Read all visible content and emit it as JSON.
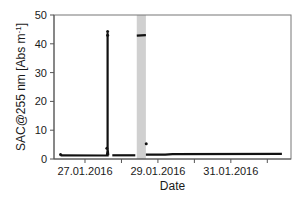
{
  "chart_data": {
    "type": "line",
    "title": "",
    "xlabel": "Date",
    "ylabel": "SAC@255 nm [Abs m-1]",
    "ylabel_parts": {
      "main": "SAC@255 nm [Abs m",
      "sup": "-1",
      "end": "]"
    },
    "ylim": [
      0,
      50
    ],
    "yticks": [
      0,
      10,
      20,
      30,
      40,
      50
    ],
    "xlim_days": [
      26.15,
      32.65
    ],
    "xticks_days": [
      27,
      28,
      29,
      30,
      31,
      32
    ],
    "xtick_labels": [
      {
        "day": 27,
        "label": "27.01.2016"
      },
      {
        "day": 29,
        "label": "29.01.2016"
      },
      {
        "day": 31,
        "label": "31.01.2016"
      }
    ],
    "grid": false,
    "legend": null,
    "shaded_regions": [
      {
        "x_start_day": 28.42,
        "x_end_day": 28.67,
        "color": "#d0d0d0"
      }
    ],
    "series": [
      {
        "name": "SAC@255 nm",
        "color": "#111111",
        "segments": [
          {
            "points": [
              [
                26.33,
                1.3
              ],
              [
                27.5,
                1.2
              ],
              [
                27.6,
                1.2
              ],
              [
                27.62,
                3.0
              ],
              [
                27.62,
                43.5
              ],
              [
                27.62,
                3.5
              ],
              [
                27.64,
                1.3
              ],
              [
                27.65,
                1.3
              ]
            ]
          },
          {
            "points": [
              [
                27.75,
                1.3
              ],
              [
                28.38,
                1.3
              ]
            ]
          },
          {
            "points": [
              [
                28.42,
                42.8
              ],
              [
                28.67,
                43.0
              ]
            ]
          },
          {
            "points": [
              [
                28.67,
                1.5
              ],
              [
                29.2,
                1.5
              ],
              [
                29.4,
                1.7
              ],
              [
                32.4,
                1.8
              ]
            ]
          }
        ],
        "markers": [
          {
            "day": 27.62,
            "value": 44.3
          },
          {
            "day": 27.62,
            "value": 43.0
          },
          {
            "day": 27.6,
            "value": 3.7
          },
          {
            "day": 28.68,
            "value": 5.3
          },
          {
            "day": 26.33,
            "value": 1.6
          }
        ]
      }
    ]
  },
  "colors": {
    "axis": "#555555",
    "frame": "#777777",
    "shade": "#d0d0d0",
    "line": "#111111"
  }
}
